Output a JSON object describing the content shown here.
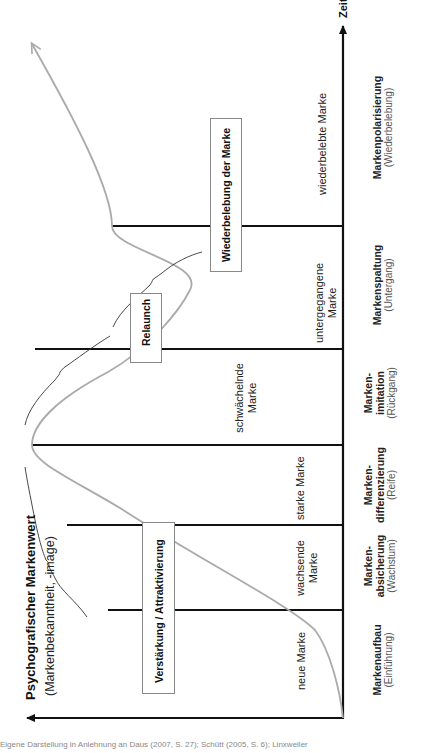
{
  "diagram": {
    "x_axis_label": "Zeit",
    "y_axis_label": "Psychografischer Markenwert",
    "y_axis_sublabel": "(Markenbekanntheit, -image)",
    "phases": [
      {
        "name_line1": "Markenaufbau",
        "name_line2": "",
        "sub": "(Einführung)",
        "brand_state_line1": "neue Marke",
        "brand_state_line2": ""
      },
      {
        "name_line1": "Marken-",
        "name_line2": "absicherung",
        "sub": "(Wachstum)",
        "brand_state_line1": "wachsende",
        "brand_state_line2": "Marke"
      },
      {
        "name_line1": "Marken-",
        "name_line2": "differenzierung",
        "sub": "(Reife)",
        "brand_state_line1": "starke Marke",
        "brand_state_line2": ""
      },
      {
        "name_line1": "Marken-",
        "name_line2": "imitation",
        "sub": "(Rückgang)",
        "brand_state_line1": "schwächelnde",
        "brand_state_line2": "Marke"
      },
      {
        "name_line1": "Markenspaltung",
        "name_line2": "",
        "sub": "(Untergang)",
        "brand_state_line1": "untergegangene",
        "brand_state_line2": "Marke"
      },
      {
        "name_line1": "Markenpolarisierung",
        "name_line2": "",
        "sub": "(Wiederbelebung)",
        "brand_state_line1": "wiederbelebte Marke",
        "brand_state_line2": ""
      }
    ],
    "strategy_boxes": [
      {
        "label": "Verstärkung / Attraktivierung"
      },
      {
        "label": "Relaunch"
      },
      {
        "label": "Wiederbelebung der Marke"
      }
    ],
    "caption": "Eigene Darstellung in Anlehnung an Daus (2007, S. 27); Schütt (2005, S. 6); Linxweiler"
  },
  "colors": {
    "axis": "#111111",
    "curve": "#aaaaaa",
    "brace": "#333333",
    "box_border": "#888888"
  }
}
